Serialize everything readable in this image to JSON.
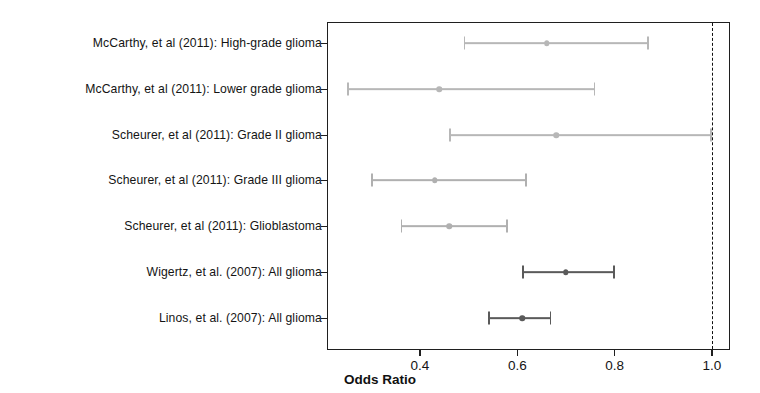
{
  "chart_data": {
    "type": "scatter",
    "plot_kind": "forest-plot",
    "title": "",
    "xlabel": "Odds Ratio",
    "ylabel": "",
    "xlim": [
      0.23,
      1.06
    ],
    "xticks": [
      0.4,
      0.6,
      0.8,
      1.0
    ],
    "xticklabels": [
      "0.4",
      "0.6",
      "0.8",
      "1.0"
    ],
    "grid": false,
    "legend": "none",
    "reference_line": {
      "value": 1.0,
      "style": "dashed",
      "color": "#111111"
    },
    "categories": [
      "McCarthy, et al (2011): High-grade glioma",
      "McCarthy, et al (2011): Lower grade glioma",
      "Scheurer, et al (2011): Grade II glioma",
      "Scheurer, et al (2011): Grade III glioma",
      "Scheurer, et al (2011): Glioblastoma",
      "Wigertz, et al. (2007): All glioma",
      "Linos, et al. (2007): All glioma"
    ],
    "series": [
      {
        "name": "Odds Ratio (95% CI)",
        "points": [
          {
            "label": "McCarthy, et al (2011): High-grade glioma",
            "estimate": 0.66,
            "ci_low": 0.49,
            "ci_high": 0.87,
            "color": "#b7b7b7"
          },
          {
            "label": "McCarthy, et al (2011): Lower grade glioma",
            "estimate": 0.44,
            "ci_low": 0.25,
            "ci_high": 0.76,
            "color": "#b7b7b7"
          },
          {
            "label": "Scheurer, et al (2011): Grade II glioma",
            "estimate": 0.68,
            "ci_low": 0.46,
            "ci_high": 1.0,
            "color": "#b7b7b7"
          },
          {
            "label": "Scheurer, et al (2011): Grade III glioma",
            "estimate": 0.43,
            "ci_low": 0.3,
            "ci_high": 0.62,
            "color": "#b0b0b0"
          },
          {
            "label": "Scheurer, et al (2011): Glioblastoma",
            "estimate": 0.46,
            "ci_low": 0.36,
            "ci_high": 0.58,
            "color": "#b0b0b0"
          },
          {
            "label": "Wigertz, et al. (2007): All glioma",
            "estimate": 0.7,
            "ci_low": 0.61,
            "ci_high": 0.8,
            "color": "#5a5a5a"
          },
          {
            "label": "Linos, et al. (2007): All glioma",
            "estimate": 0.61,
            "ci_low": 0.54,
            "ci_high": 0.67,
            "color": "#5a5a5a"
          }
        ]
      }
    ]
  }
}
